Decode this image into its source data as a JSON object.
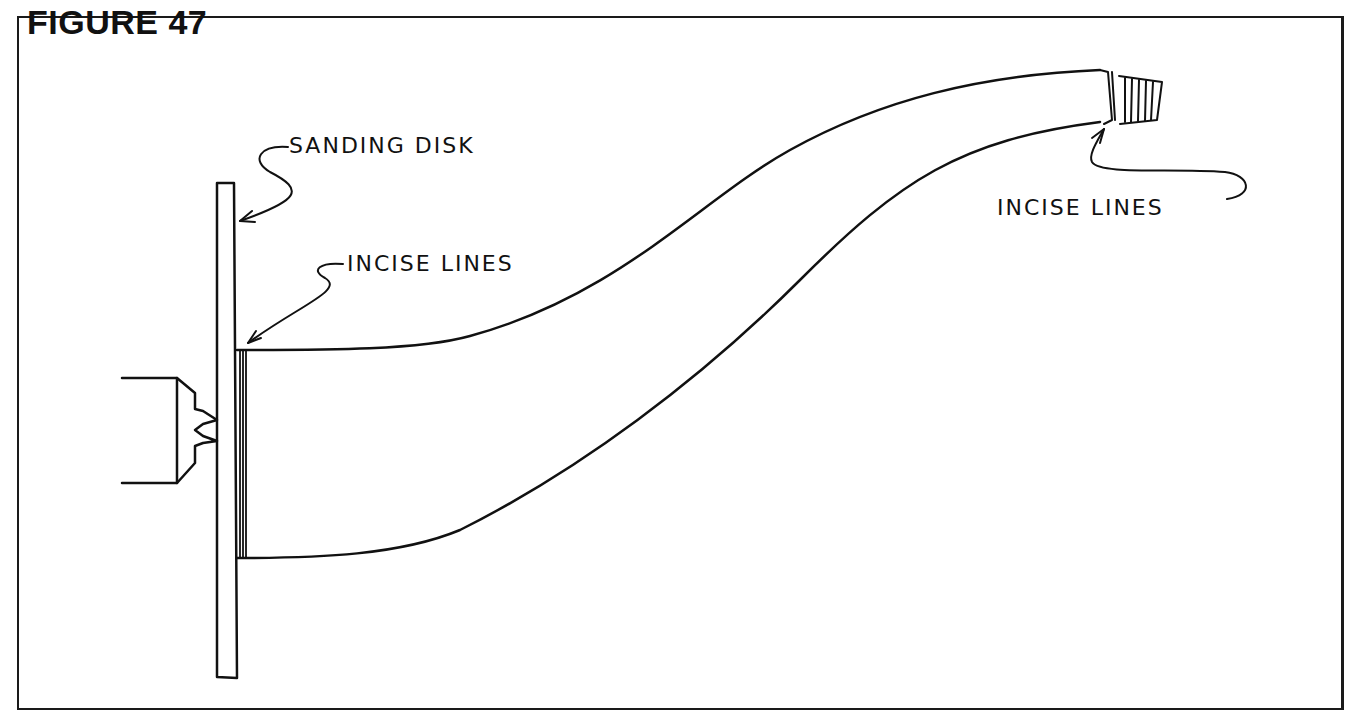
{
  "figure": {
    "title": "FIGURE 47",
    "labels": {
      "sanding_disk": "SANDING DISK",
      "incise_lines_left": "INCISE LINES",
      "incise_lines_right": "INCISE LINES"
    },
    "stroke_color": "#111111",
    "background_color": "#ffffff"
  }
}
